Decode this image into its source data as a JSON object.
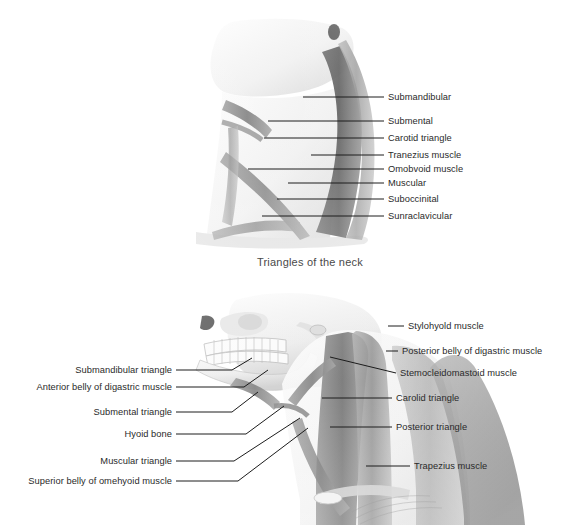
{
  "page": {
    "background": "#ffffff",
    "text_color": "#2a2a2a",
    "caption_color": "#4a4a4a"
  },
  "figure_top": {
    "caption": "Triangles of the neck",
    "illustration_name": "neck-profile-illustration",
    "labels_right": [
      {
        "text": "Submandibular",
        "x": 388,
        "y": 92,
        "line_x1": 303,
        "line_y1": 97,
        "line_x2": 384,
        "line_y2": 97
      },
      {
        "text": "Submental",
        "x": 388,
        "y": 116,
        "line_x1": 268,
        "line_y1": 121,
        "line_x2": 384,
        "line_y2": 121
      },
      {
        "text": "Carotid triangle",
        "x": 388,
        "y": 133,
        "line_x1": 264,
        "line_y1": 138,
        "line_x2": 384,
        "line_y2": 138
      },
      {
        "text": "Tranezius muscle",
        "x": 388,
        "y": 150,
        "line_x1": 311,
        "line_y1": 155,
        "line_x2": 384,
        "line_y2": 155
      },
      {
        "text": "Omobvoid muscle",
        "x": 388,
        "y": 164,
        "line_x1": 248,
        "line_y1": 169,
        "line_x2": 384,
        "line_y2": 169
      },
      {
        "text": "Muscular",
        "x": 388,
        "y": 178,
        "line_x1": 288,
        "line_y1": 183,
        "line_x2": 384,
        "line_y2": 183
      },
      {
        "text": "Suboccinital",
        "x": 388,
        "y": 194,
        "line_x1": 277,
        "line_y1": 199,
        "line_x2": 384,
        "line_y2": 199
      },
      {
        "text": "Sunraclavicular",
        "x": 388,
        "y": 211,
        "line_x1": 262,
        "line_y1": 216,
        "line_x2": 384,
        "line_y2": 216
      }
    ]
  },
  "figure_bottom": {
    "illustration_name": "skull-neck-illustration",
    "labels_right": [
      {
        "text": "Stylohyold muscle",
        "x": 408,
        "y": 321,
        "pts": "388,326 404,326"
      },
      {
        "text": "Posterior belly of digastric muscle",
        "x": 402,
        "y": 346,
        "pts": "386,351 398,351"
      },
      {
        "text": "Stemocleidomastoid muscle",
        "x": 400,
        "y": 368,
        "pts": "330,357 396,373"
      },
      {
        "text": "Carolid triangle",
        "x": 396,
        "y": 393,
        "pts": "322,398 392,398"
      },
      {
        "text": "Posterior triangle",
        "x": 396,
        "y": 422,
        "pts": "330,427 392,427"
      },
      {
        "text": "Trapezius muscle",
        "x": 414,
        "y": 461,
        "pts": "366,466 410,466"
      }
    ],
    "labels_left": [
      {
        "text": "Submandibular triangle",
        "x": 172,
        "y": 365,
        "pts": "176,370 232,370 252,358"
      },
      {
        "text": "Anterior belly of digastric muscle",
        "x": 172,
        "y": 382,
        "pts": "176,387 244,387 268,370"
      },
      {
        "text": "Submental triangle",
        "x": 172,
        "y": 407,
        "pts": "176,412 232,412 258,392"
      },
      {
        "text": "Hyoid bone",
        "x": 172,
        "y": 429,
        "pts": "176,434 246,434 284,406"
      },
      {
        "text": "Muscular triangle",
        "x": 172,
        "y": 456,
        "pts": "176,461 234,461 300,418"
      },
      {
        "text": "Superior belly of omehyoid muscle",
        "x": 172,
        "y": 476,
        "pts": "176,481 238,481 308,428"
      }
    ]
  }
}
